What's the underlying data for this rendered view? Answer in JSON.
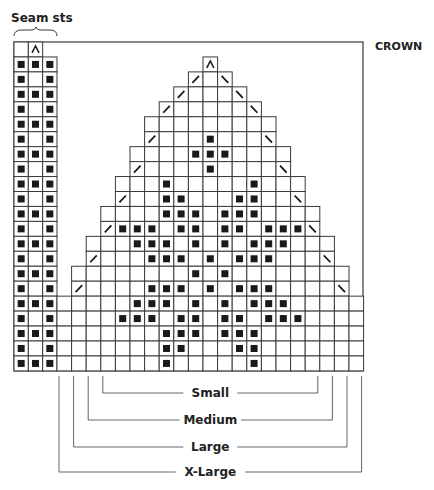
{
  "labels": {
    "seam": "Seam sts",
    "crown": "CROWN",
    "sizes": [
      "Small",
      "Medium",
      "Large",
      "X-Large"
    ]
  },
  "colors": {
    "line": "#3a3a3a",
    "dot": "#1a1a1a",
    "bg": "#ffffff"
  },
  "symbols": {
    "decrease_center": "^",
    "k2tog": "/",
    "ssk": "\\",
    "purl": "■"
  },
  "grid": {
    "rows": 22,
    "seam_cols": 3,
    "main_cols": 21,
    "seam": {
      "top_row_symbol_col": 1,
      "full_rows_dots": [
        0,
        1,
        2
      ],
      "edge_rows_dots": [
        0,
        2
      ]
    },
    "main_rows": [
      {
        "r": 1,
        "from": 10,
        "to": 10,
        "dots": [],
        "left_dec": null,
        "right_dec": null,
        "center": 10
      },
      {
        "r": 2,
        "from": 9,
        "to": 11,
        "dots": [],
        "left_dec": 9,
        "right_dec": 11
      },
      {
        "r": 3,
        "from": 8,
        "to": 12,
        "dots": [],
        "left_dec": 8,
        "right_dec": 12
      },
      {
        "r": 4,
        "from": 7,
        "to": 13,
        "dots": [],
        "left_dec": 7,
        "right_dec": 13
      },
      {
        "r": 5,
        "from": 6,
        "to": 14,
        "dots": []
      },
      {
        "r": 6,
        "from": 6,
        "to": 14,
        "dots": [
          10
        ],
        "left_dec": 6,
        "right_dec": 14
      },
      {
        "r": 7,
        "from": 5,
        "to": 15,
        "dots": [
          9,
          10,
          11
        ]
      },
      {
        "r": 8,
        "from": 5,
        "to": 15,
        "dots": [
          10
        ],
        "left_dec": 5,
        "right_dec": 15
      },
      {
        "r": 9,
        "from": 4,
        "to": 16,
        "dots": [
          7,
          13
        ]
      },
      {
        "r": 10,
        "from": 4,
        "to": 16,
        "dots": [
          7,
          8,
          12,
          13
        ],
        "left_dec": 4,
        "right_dec": 16
      },
      {
        "r": 11,
        "from": 3,
        "to": 17,
        "dots": [
          7,
          8,
          9,
          11,
          12,
          13
        ]
      },
      {
        "r": 12,
        "from": 3,
        "to": 17,
        "dots": [
          4,
          5,
          6,
          8,
          9,
          11,
          12,
          14,
          15,
          16
        ],
        "left_dec": 3,
        "right_dec": 17
      },
      {
        "r": 13,
        "from": 2,
        "to": 18,
        "dots": [
          5,
          6,
          7,
          9,
          11,
          13,
          14,
          15
        ]
      },
      {
        "r": 14,
        "from": 2,
        "to": 18,
        "dots": [
          6,
          7,
          8,
          10,
          12,
          13,
          14
        ],
        "left_dec": 2,
        "right_dec": 18
      },
      {
        "r": 15,
        "from": 1,
        "to": 19,
        "dots": [
          9,
          11
        ]
      },
      {
        "r": 16,
        "from": 1,
        "to": 19,
        "dots": [
          6,
          7,
          8,
          10,
          12,
          13,
          14
        ],
        "left_dec": 1,
        "right_dec": 19
      },
      {
        "r": 17,
        "from": 0,
        "to": 20,
        "dots": [
          5,
          6,
          7,
          9,
          11,
          13,
          14,
          15
        ]
      },
      {
        "r": 18,
        "from": 0,
        "to": 20,
        "dots": [
          4,
          5,
          6,
          8,
          9,
          11,
          12,
          14,
          15,
          16
        ]
      },
      {
        "r": 19,
        "from": 0,
        "to": 20,
        "dots": [
          7,
          8,
          9,
          11,
          12,
          13
        ]
      },
      {
        "r": 20,
        "from": 0,
        "to": 20,
        "dots": [
          7,
          8,
          12,
          13
        ]
      },
      {
        "r": 21,
        "from": 0,
        "to": 20,
        "dots": [
          7,
          13
        ]
      }
    ],
    "size_brackets": [
      {
        "label_index": 0,
        "from_col": 3,
        "to_col": 17,
        "y": 393
      },
      {
        "label_index": 1,
        "from_col": 2,
        "to_col": 18,
        "y": 420
      },
      {
        "label_index": 2,
        "from_col": 1,
        "to_col": 19,
        "y": 447
      },
      {
        "label_index": 3,
        "from_col": 0,
        "to_col": 20,
        "y": 472
      }
    ]
  }
}
